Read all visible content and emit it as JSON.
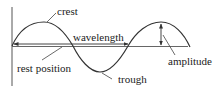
{
  "diagram": {
    "type": "transverse-wave",
    "labels": {
      "crest": "crest",
      "wavelength": "wavelength",
      "rest_position": "rest position",
      "trough": "trough",
      "amplitude": "amplitude"
    },
    "colors": {
      "line": "#333333",
      "background": "#ffffff"
    }
  }
}
